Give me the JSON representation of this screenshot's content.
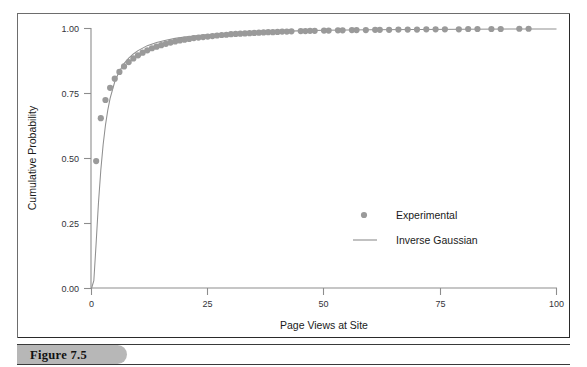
{
  "figure": {
    "caption_label": "Figure 7.5"
  },
  "chart_data": {
    "type": "scatter",
    "title": "",
    "xlabel": "Page Views at Site",
    "ylabel": "Cumulative Probability",
    "xlim": [
      0,
      100
    ],
    "ylim": [
      0.0,
      1.0
    ],
    "grid": false,
    "xticks": [
      0,
      25,
      50,
      75,
      100
    ],
    "xtick_labels": [
      "0",
      "25",
      "50",
      "75",
      "100"
    ],
    "yticks": [
      0.0,
      0.25,
      0.5,
      0.75,
      1.0
    ],
    "ytick_labels": [
      "0.00",
      "0.25",
      "0.50",
      "0.75",
      "1.00"
    ],
    "legend_position": "center-right-inside",
    "marker_color": "#9a9a9a",
    "line_color": "#8f8f8f",
    "series": [
      {
        "name": "Experimental",
        "type": "scatter",
        "marker": "circle",
        "color": "#9a9a9a",
        "x": [
          1,
          2,
          3,
          4,
          5,
          6,
          7,
          8,
          9,
          10,
          11,
          12,
          13,
          14,
          15,
          16,
          17,
          18,
          19,
          20,
          21,
          22,
          23,
          24,
          25,
          26,
          27,
          28,
          29,
          30,
          31,
          32,
          33,
          34,
          35,
          36,
          37,
          38,
          39,
          40,
          41,
          42,
          43,
          45,
          46,
          47,
          48,
          50,
          51,
          53,
          54,
          56,
          57,
          59,
          61,
          62,
          64,
          66,
          68,
          70,
          72,
          74,
          76,
          79,
          81,
          83,
          86,
          88,
          92,
          94
        ],
        "y": [
          0.49,
          0.655,
          0.725,
          0.772,
          0.807,
          0.833,
          0.854,
          0.871,
          0.885,
          0.897,
          0.907,
          0.916,
          0.924,
          0.93,
          0.936,
          0.941,
          0.946,
          0.95,
          0.954,
          0.957,
          0.96,
          0.963,
          0.965,
          0.967,
          0.969,
          0.971,
          0.973,
          0.975,
          0.976,
          0.978,
          0.979,
          0.98,
          0.981,
          0.982,
          0.983,
          0.984,
          0.985,
          0.986,
          0.986,
          0.987,
          0.988,
          0.988,
          0.989,
          0.99,
          0.99,
          0.991,
          0.991,
          0.992,
          0.992,
          0.993,
          0.993,
          0.994,
          0.994,
          0.994,
          0.995,
          0.995,
          0.995,
          0.996,
          0.996,
          0.996,
          0.997,
          0.997,
          0.997,
          0.997,
          0.998,
          0.998,
          0.998,
          0.998,
          0.999,
          0.999
        ]
      },
      {
        "name": "Inverse Gaussian",
        "type": "line",
        "color": "#8f8f8f",
        "x": [
          0.0,
          0.5,
          1.0,
          1.5,
          2.0,
          2.5,
          3.0,
          3.5,
          4.0,
          5.0,
          6.0,
          7.0,
          8.0,
          9.0,
          10.0,
          12.0,
          14.0,
          16.0,
          18.0,
          20.0,
          24.0,
          28.0,
          32.0,
          36.0,
          40.0,
          50.0,
          60.0,
          70.0,
          80.0,
          90.0,
          100.0
        ],
        "y": [
          0.0,
          0.03,
          0.175,
          0.33,
          0.455,
          0.553,
          0.628,
          0.686,
          0.731,
          0.795,
          0.836,
          0.865,
          0.886,
          0.902,
          0.915,
          0.934,
          0.946,
          0.955,
          0.962,
          0.967,
          0.975,
          0.98,
          0.984,
          0.987,
          0.989,
          0.993,
          0.995,
          0.996,
          0.997,
          0.998,
          0.998
        ]
      }
    ],
    "legend": [
      {
        "label": "Experimental",
        "marker": "circle",
        "color": "#9a9a9a"
      },
      {
        "label": "Inverse Gaussian",
        "marker": "line",
        "color": "#8f8f8f"
      }
    ]
  }
}
